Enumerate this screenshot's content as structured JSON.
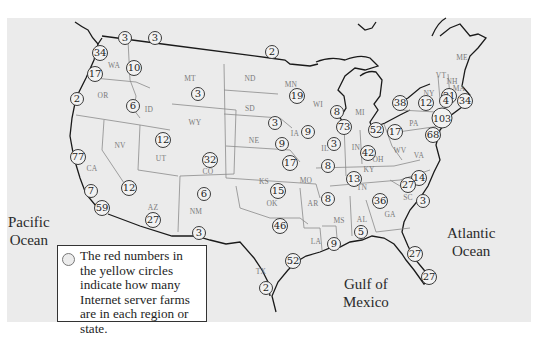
{
  "map": {
    "background_color": "#ebebeb",
    "legend": {
      "text": "The red numbers in the yellow circles indicate how many Internet server farms are in each region or state."
    },
    "oceans": [
      {
        "id": "pacific",
        "line1": "Pacific",
        "line2": "Ocean",
        "x": 8,
        "y": 213
      },
      {
        "id": "atlantic",
        "line1": "Atlantic",
        "line2": "Ocean",
        "x": 447,
        "y": 224
      },
      {
        "id": "gulf",
        "line1": "Gulf of",
        "line2": "Mexico",
        "x": 343,
        "y": 275
      }
    ],
    "state_labels": [
      {
        "abbr": "WA",
        "x": 114,
        "y": 65
      },
      {
        "abbr": "OR",
        "x": 103,
        "y": 95
      },
      {
        "abbr": "ID",
        "x": 149,
        "y": 109
      },
      {
        "abbr": "MT",
        "x": 190,
        "y": 78
      },
      {
        "abbr": "WY",
        "x": 195,
        "y": 122
      },
      {
        "abbr": "ND",
        "x": 250,
        "y": 78
      },
      {
        "abbr": "SD",
        "x": 250,
        "y": 108
      },
      {
        "abbr": "NE",
        "x": 254,
        "y": 140
      },
      {
        "abbr": "MN",
        "x": 291,
        "y": 84
      },
      {
        "abbr": "WI",
        "x": 318,
        "y": 104
      },
      {
        "abbr": "MI",
        "x": 360,
        "y": 112
      },
      {
        "abbr": "IA",
        "x": 295,
        "y": 133
      },
      {
        "abbr": "IL",
        "x": 325,
        "y": 148
      },
      {
        "abbr": "IN",
        "x": 356,
        "y": 147
      },
      {
        "abbr": "OH",
        "x": 378,
        "y": 159
      },
      {
        "abbr": "PA",
        "x": 414,
        "y": 123
      },
      {
        "abbr": "NY",
        "x": 429,
        "y": 93
      },
      {
        "abbr": "ME",
        "x": 462,
        "y": 57
      },
      {
        "abbr": "VT",
        "x": 441,
        "y": 75
      },
      {
        "abbr": "NH",
        "x": 452,
        "y": 81
      },
      {
        "abbr": "MA",
        "x": 459,
        "y": 88
      },
      {
        "abbr": "NV",
        "x": 120,
        "y": 145
      },
      {
        "abbr": "CA",
        "x": 92,
        "y": 168
      },
      {
        "abbr": "UT",
        "x": 161,
        "y": 158
      },
      {
        "abbr": "CO",
        "x": 208,
        "y": 171
      },
      {
        "abbr": "KS",
        "x": 264,
        "y": 181
      },
      {
        "abbr": "MO",
        "x": 306,
        "y": 180
      },
      {
        "abbr": "KY",
        "x": 369,
        "y": 169
      },
      {
        "abbr": "WV",
        "x": 400,
        "y": 150
      },
      {
        "abbr": "VA",
        "x": 419,
        "y": 155
      },
      {
        "abbr": "TN",
        "x": 362,
        "y": 187
      },
      {
        "abbr": "AZ",
        "x": 153,
        "y": 207
      },
      {
        "abbr": "NM",
        "x": 196,
        "y": 211
      },
      {
        "abbr": "OK",
        "x": 272,
        "y": 203
      },
      {
        "abbr": "AR",
        "x": 313,
        "y": 203
      },
      {
        "abbr": "MS",
        "x": 339,
        "y": 220
      },
      {
        "abbr": "AL",
        "x": 362,
        "y": 219
      },
      {
        "abbr": "GA",
        "x": 390,
        "y": 214
      },
      {
        "abbr": "SC",
        "x": 408,
        "y": 197
      },
      {
        "abbr": "TX",
        "x": 261,
        "y": 271
      },
      {
        "abbr": "LA",
        "x": 316,
        "y": 241
      }
    ],
    "markers": [
      {
        "value": "3",
        "region": "BC",
        "x": 125,
        "y": 38
      },
      {
        "value": "3",
        "region": "Alberta",
        "x": 155,
        "y": 38
      },
      {
        "value": "34",
        "region": "WA-coast",
        "x": 100,
        "y": 53
      },
      {
        "value": "10",
        "region": "WA",
        "x": 134,
        "y": 68
      },
      {
        "value": "17",
        "region": "WA-south",
        "x": 95,
        "y": 74
      },
      {
        "value": "2",
        "region": "OR",
        "x": 77,
        "y": 99
      },
      {
        "value": "6",
        "region": "ID",
        "x": 133,
        "y": 106
      },
      {
        "value": "3",
        "region": "MT",
        "x": 198,
        "y": 94
      },
      {
        "value": "2",
        "region": "ND-MN border",
        "x": 272,
        "y": 52
      },
      {
        "value": "19",
        "region": "MN",
        "x": 297,
        "y": 96
      },
      {
        "value": "8",
        "region": "WI",
        "x": 337,
        "y": 112
      },
      {
        "value": "73",
        "region": "IL-Chicago",
        "x": 344,
        "y": 127
      },
      {
        "value": "3",
        "region": "NE-SD",
        "x": 275,
        "y": 123
      },
      {
        "value": "9",
        "region": "IA",
        "x": 308,
        "y": 132
      },
      {
        "value": "9",
        "region": "NE",
        "x": 282,
        "y": 144
      },
      {
        "value": "3",
        "region": "IL",
        "x": 334,
        "y": 144
      },
      {
        "value": "17",
        "region": "KS",
        "x": 290,
        "y": 163
      },
      {
        "value": "8",
        "region": "MO",
        "x": 328,
        "y": 166
      },
      {
        "value": "52",
        "region": "OH-north",
        "x": 376,
        "y": 130
      },
      {
        "value": "17",
        "region": "OH",
        "x": 395,
        "y": 132
      },
      {
        "value": "42",
        "region": "IN-KY",
        "x": 368,
        "y": 153
      },
      {
        "value": "38",
        "region": "NY-west",
        "x": 400,
        "y": 103
      },
      {
        "value": "12",
        "region": "NY",
        "x": 426,
        "y": 103
      },
      {
        "value": "31",
        "region": "ME",
        "x": 449,
        "y": 96
      },
      {
        "value": "4",
        "region": "NY-east",
        "x": 446,
        "y": 101
      },
      {
        "value": "34",
        "region": "MA",
        "x": 465,
        "y": 101
      },
      {
        "value": "103",
        "region": "NJ-NYC",
        "x": 442,
        "y": 118
      },
      {
        "value": "68",
        "region": "MD-DC",
        "x": 433,
        "y": 135
      },
      {
        "value": "12",
        "region": "UT",
        "x": 163,
        "y": 140
      },
      {
        "value": "32",
        "region": "CO",
        "x": 210,
        "y": 160
      },
      {
        "value": "77",
        "region": "CA-north",
        "x": 78,
        "y": 157
      },
      {
        "value": "12",
        "region": "CA-east",
        "x": 129,
        "y": 188
      },
      {
        "value": "7",
        "region": "CA-central",
        "x": 91,
        "y": 191
      },
      {
        "value": "59",
        "region": "CA-south",
        "x": 102,
        "y": 208
      },
      {
        "value": "27",
        "region": "AZ",
        "x": 153,
        "y": 220
      },
      {
        "value": "6",
        "region": "NM",
        "x": 204,
        "y": 194
      },
      {
        "value": "3",
        "region": "NM-south",
        "x": 199,
        "y": 233
      },
      {
        "value": "15",
        "region": "OK",
        "x": 278,
        "y": 191
      },
      {
        "value": "46",
        "region": "TX-north",
        "x": 280,
        "y": 226
      },
      {
        "value": "8",
        "region": "AR",
        "x": 328,
        "y": 199
      },
      {
        "value": "13",
        "region": "TN",
        "x": 354,
        "y": 179
      },
      {
        "value": "14",
        "region": "NC",
        "x": 419,
        "y": 178
      },
      {
        "value": "27",
        "region": "NC-SC",
        "x": 408,
        "y": 185
      },
      {
        "value": "36",
        "region": "GA",
        "x": 380,
        "y": 201
      },
      {
        "value": "3",
        "region": "SC",
        "x": 423,
        "y": 201
      },
      {
        "value": "5",
        "region": "AL",
        "x": 361,
        "y": 232
      },
      {
        "value": "9",
        "region": "MS-LA",
        "x": 334,
        "y": 244
      },
      {
        "value": "52",
        "region": "TX-Houston",
        "x": 293,
        "y": 261
      },
      {
        "value": "2",
        "region": "TX-south",
        "x": 266,
        "y": 288
      },
      {
        "value": "27",
        "region": "FL-north",
        "x": 415,
        "y": 254
      },
      {
        "value": "27",
        "region": "FL-south",
        "x": 429,
        "y": 277
      }
    ]
  }
}
